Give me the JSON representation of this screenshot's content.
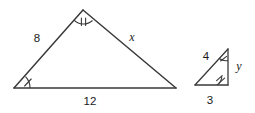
{
  "figure": {
    "stroke_color": "#3a3a3a",
    "text_color": "#1a1a1a",
    "background_color": "#ffffff",
    "large_triangle": {
      "name": "large-triangle",
      "labels": {
        "left_side": "8",
        "right_side": "x",
        "base": "12"
      },
      "angle_marks": {
        "apex": "double-tick",
        "bottom_left": "single-tick"
      }
    },
    "small_triangle": {
      "name": "small-triangle",
      "labels": {
        "hypotenuse": "4",
        "right_side": "y",
        "base": "3"
      },
      "angle_marks": {
        "top_right": "single-tick",
        "bottom_right": "double-tick"
      }
    }
  }
}
